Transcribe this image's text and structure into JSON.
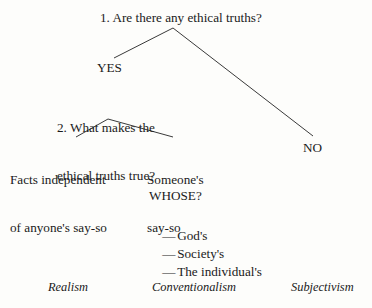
{
  "diagram": {
    "title_text": "1. Are there any ethical truths?",
    "background_color": "#fdfdfb",
    "line_color": "#3a3a3a",
    "text_color": "#1a1a1a",
    "nodes": {
      "question_1": "1. Are there any ethical truths?",
      "yes_label": "YES",
      "no_label": "NO",
      "question_2_line_1": "2. What makes the",
      "question_2_line_2": "ethical truths true?",
      "leaf_facts_line_1": "Facts independent",
      "leaf_facts_line_2": "of anyone's say-so",
      "leaf_someone_line_1": "Someone's",
      "leaf_someone_line_2": "say-so",
      "whose_label": "WHOSE?"
    },
    "whose_options": [
      {
        "dash": "—",
        "label": "God's"
      },
      {
        "dash": "—",
        "label": "Society's"
      },
      {
        "dash": "—",
        "label": "The individual's"
      }
    ],
    "theories": [
      {
        "label": "Realism"
      },
      {
        "label": "Conventionalism"
      },
      {
        "label": "Subjectivism"
      }
    ]
  }
}
